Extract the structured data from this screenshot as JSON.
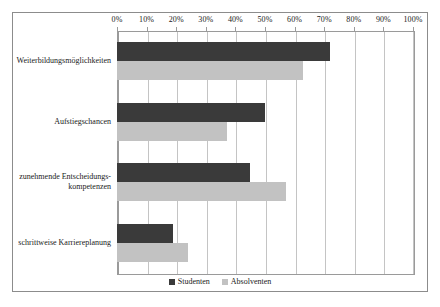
{
  "chart_data": {
    "type": "bar",
    "orientation": "horizontal",
    "title": "",
    "xlabel": "",
    "ylabel": "",
    "xlim": [
      0,
      100
    ],
    "xticks": [
      "0%",
      "10%",
      "20%",
      "30%",
      "40%",
      "50%",
      "60%",
      "70%",
      "80%",
      "90%",
      "100%"
    ],
    "xtick_values": [
      0,
      10,
      20,
      30,
      40,
      50,
      60,
      70,
      80,
      90,
      100
    ],
    "grid": true,
    "legend_position": "bottom",
    "categories": [
      "Weiterbildungsmöglichkeiten",
      "Aufstiegschancen",
      "zunehmende Entscheidungs-\nkompetenzen",
      "schrittweise Karriereplanung"
    ],
    "category_lines": [
      [
        "Weiterbildungsmöglichkeiten"
      ],
      [
        "Aufstiegschancen"
      ],
      [
        "zunehmende Entscheidungs-",
        "kompetenzen"
      ],
      [
        "schrittweise Karriereplanung"
      ]
    ],
    "series": [
      {
        "name": "Studenten",
        "color": "#3a3a3a",
        "values": [
          72,
          50,
          45,
          19
        ]
      },
      {
        "name": "Absolventen",
        "color": "#c2c2c2",
        "values": [
          63,
          37,
          57,
          24
        ]
      }
    ]
  },
  "legend": {
    "entries": [
      {
        "label": "Studenten"
      },
      {
        "label": "Absolventen"
      }
    ]
  }
}
